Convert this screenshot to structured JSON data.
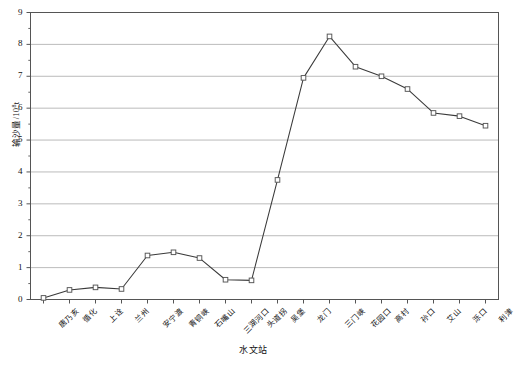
{
  "chart_data": {
    "type": "line",
    "title": "",
    "xlabel": "水文站",
    "ylabel": "输沙量/10⁸t",
    "ylabel_main": "输沙量/10",
    "ylabel_exp": "8",
    "ylabel_unit": "t",
    "ylim": [
      0,
      9
    ],
    "ytick_labels": [
      "0",
      "1",
      "2",
      "3",
      "4",
      "5",
      "6",
      "7",
      "8",
      "9"
    ],
    "ytick_values": [
      0,
      1,
      2,
      3,
      4,
      5,
      6,
      7,
      8,
      9
    ],
    "grid": true,
    "grid_axis": "y",
    "legend": "none",
    "marker": "open-square",
    "line_color": "#3a3a3a",
    "marker_edge_color": "#555555",
    "marker_face_color": "#ffffff",
    "grid_color": "#b3b3b3",
    "axis_color": "#555555",
    "categories": [
      "唐乃亥",
      "循化",
      "上诠",
      "兰州",
      "安宁渡",
      "青铜峡",
      "石嘴山",
      "三湖河口",
      "头道拐",
      "吴堡",
      "龙门",
      "三门峡",
      "花园口",
      "高村",
      "孙口",
      "艾山",
      "泺口",
      "利津"
    ],
    "values": [
      0.05,
      0.3,
      0.38,
      0.33,
      1.38,
      1.48,
      1.3,
      0.62,
      0.6,
      3.75,
      6.95,
      8.25,
      7.3,
      7.0,
      6.6,
      5.85,
      5.75,
      5.45
    ],
    "series": [
      {
        "name": "输沙量",
        "values": [
          0.05,
          0.3,
          0.38,
          0.33,
          1.38,
          1.48,
          1.3,
          0.62,
          0.6,
          3.75,
          6.95,
          8.25,
          7.3,
          7.0,
          6.6,
          5.85,
          5.75,
          5.45
        ]
      }
    ]
  }
}
